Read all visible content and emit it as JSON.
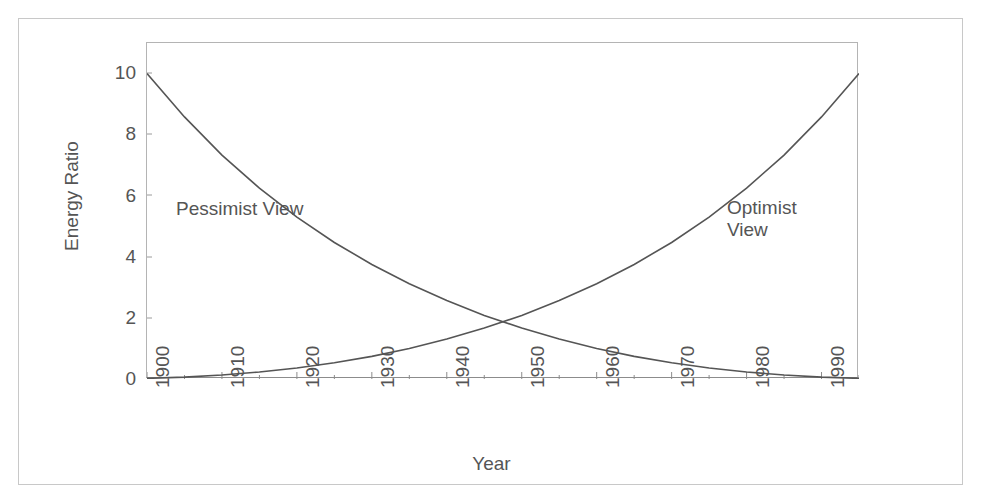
{
  "chart_data": {
    "type": "line",
    "title": "",
    "xlabel": "Year",
    "ylabel": "Energy Ratio",
    "xlim": [
      1900,
      1995
    ],
    "ylim": [
      0,
      11
    ],
    "xticks": [
      "1900",
      "1910",
      "1920",
      "1930",
      "1940",
      "1950",
      "1960",
      "1970",
      "1980",
      "1990"
    ],
    "xtick_values": [
      1900,
      1910,
      1920,
      1930,
      1940,
      1950,
      1960,
      1970,
      1980,
      1990
    ],
    "yticks": [
      "0",
      "2",
      "4",
      "6",
      "8",
      "10"
    ],
    "ytick_values": [
      0,
      2,
      4,
      6,
      8,
      10
    ],
    "grid": false,
    "legend": "inline-annotations",
    "line_color": "#555555",
    "frame_color": "#b4b4b4",
    "background": "#ffffff",
    "annotations": [
      {
        "name": "pessimist-view-label",
        "text": "Pessimist  View",
        "x": 1917,
        "y": 5.7
      },
      {
        "name": "optimist-view-label",
        "text": "Optimist\nView",
        "x": 1983,
        "y": 5.8
      }
    ],
    "series": [
      {
        "name": "Pessimist View",
        "x": [
          1900,
          1905,
          1910,
          1915,
          1920,
          1925,
          1930,
          1935,
          1940,
          1945,
          1950,
          1955,
          1960,
          1965,
          1970,
          1975,
          1980,
          1985,
          1990,
          1995
        ],
        "values": [
          10.0,
          8.58,
          7.33,
          6.25,
          5.3,
          4.47,
          3.75,
          3.12,
          2.57,
          2.08,
          1.67,
          1.31,
          1.0,
          0.74,
          0.53,
          0.36,
          0.23,
          0.13,
          0.06,
          0.02
        ]
      },
      {
        "name": "Optimist View",
        "x": [
          1900,
          1905,
          1910,
          1915,
          1920,
          1925,
          1930,
          1935,
          1940,
          1945,
          1950,
          1955,
          1960,
          1965,
          1970,
          1975,
          1980,
          1985,
          1990,
          1995
        ],
        "values": [
          0.02,
          0.06,
          0.13,
          0.23,
          0.36,
          0.53,
          0.74,
          1.0,
          1.31,
          1.67,
          2.08,
          2.57,
          3.12,
          3.75,
          4.47,
          5.3,
          6.25,
          7.33,
          8.58,
          10.0
        ]
      }
    ]
  },
  "axis": {
    "ylabel_text": "Energy Ratio",
    "xlabel_text": "Year",
    "ytick_0": "0",
    "ytick_1": "2",
    "ytick_2": "4",
    "ytick_3": "6",
    "ytick_4": "8",
    "ytick_5": "10",
    "xtick_0": "1900",
    "xtick_1": "1910",
    "xtick_2": "1920",
    "xtick_3": "1930",
    "xtick_4": "1940",
    "xtick_5": "1950",
    "xtick_6": "1960",
    "xtick_7": "1970",
    "xtick_8": "1980",
    "xtick_9": "1990"
  },
  "labels": {
    "pessimist": "Pessimist  View",
    "optimist_line1": "Optimist",
    "optimist_line2": "View"
  }
}
